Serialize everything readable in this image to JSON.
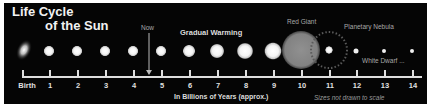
{
  "title": {
    "line1": "Life Cycle",
    "line2": "of the Sun"
  },
  "annotations": {
    "now": "Now",
    "gradual_warming": "Gradual Warming",
    "red_giant": "Red Giant",
    "planetary_nebula": "Planetary Nebula",
    "white_dwarf": "White Dwarf ...",
    "axis_label": "In Billions of Years (approx.)",
    "scale_note": "Sizes not drawn to scale"
  },
  "timeline": {
    "ticks": [
      "Birth",
      "1",
      "2",
      "3",
      "4",
      "5",
      "6",
      "7",
      "8",
      "9",
      "10",
      "11",
      "12",
      "13",
      "14"
    ]
  },
  "stages": [
    {
      "age": "Birth",
      "label": "Protostar",
      "size": 10
    },
    {
      "age": "1",
      "size": 10
    },
    {
      "age": "2",
      "size": 10
    },
    {
      "age": "3",
      "size": 10
    },
    {
      "age": "4",
      "size": 10
    },
    {
      "age": "5",
      "size": 10
    },
    {
      "age": "6",
      "size": 11
    },
    {
      "age": "7",
      "size": 13
    },
    {
      "age": "8",
      "size": 15
    },
    {
      "age": "9",
      "size": 16
    },
    {
      "age": "10",
      "label": "Red Giant",
      "size": 38
    },
    {
      "age": "11",
      "label": "Planetary Nebula",
      "size": 7
    },
    {
      "age": "12",
      "size": 4
    },
    {
      "age": "13",
      "size": 3
    },
    {
      "age": "14",
      "label": "White Dwarf",
      "size": 3
    }
  ],
  "colors": {
    "background": "#050505",
    "frame": "#ffffff",
    "text": "#e0e0e0",
    "red_giant": "#8a8a8a"
  }
}
